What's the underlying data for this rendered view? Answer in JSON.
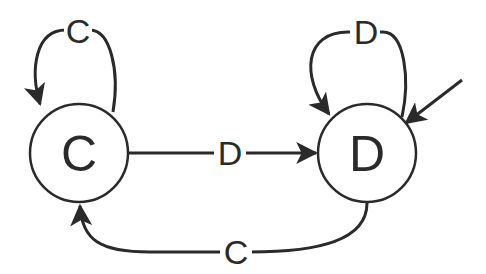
{
  "diagram": {
    "type": "state-machine",
    "colors": {
      "stroke": "#2a2a2a",
      "background": "#ffffff"
    },
    "states": [
      {
        "id": "C",
        "label": "C",
        "initial": false
      },
      {
        "id": "D",
        "label": "D",
        "initial": true
      }
    ],
    "transitions": [
      {
        "from": "C",
        "to": "C",
        "label": "C"
      },
      {
        "from": "D",
        "to": "D",
        "label": "D"
      },
      {
        "from": "C",
        "to": "D",
        "label": "D"
      },
      {
        "from": "D",
        "to": "C",
        "label": "C"
      }
    ]
  }
}
